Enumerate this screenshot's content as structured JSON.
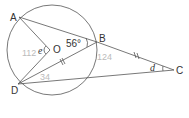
{
  "diagram": {
    "points": {
      "A": {
        "label": "A",
        "x": 19,
        "y": 17
      },
      "B": {
        "label": "B",
        "x": 97,
        "y": 42
      },
      "C": {
        "label": "C",
        "x": 174,
        "y": 70
      },
      "D": {
        "label": "D",
        "x": 18,
        "y": 84
      },
      "O": {
        "label": "O",
        "x": 50,
        "y": 50
      }
    },
    "circle": {
      "cx": 52,
      "cy": 50,
      "r": 45
    },
    "angles": {
      "ABD": "56°",
      "AOD": "e",
      "BCD": "d"
    },
    "annotations": {
      "near_e": "112",
      "near_B": "124",
      "near_D": "34"
    },
    "colors": {
      "line": "#555555",
      "pencil": "#bbbbbb"
    }
  }
}
